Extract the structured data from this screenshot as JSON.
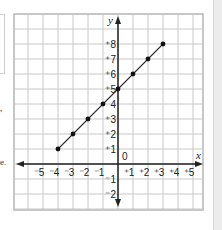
{
  "chart_data": {
    "type": "line",
    "title": "",
    "xlabel": "x",
    "ylabel": "y",
    "origin_label": "0",
    "xlim": [
      -5,
      5
    ],
    "ylim": [
      -2,
      8
    ],
    "grid": true,
    "x_ticks": [
      "-5",
      "-4",
      "-3",
      "-2",
      "-1",
      "+1",
      "+2",
      "+3",
      "+4",
      "+5"
    ],
    "y_ticks": [
      "+8",
      "+7",
      "+6",
      "+5",
      "4",
      "+3",
      "+2",
      "+1",
      "-1",
      "-2"
    ],
    "series": [
      {
        "name": "line",
        "x": [
          -4,
          -3,
          -2,
          -1,
          0,
          1,
          2,
          3
        ],
        "y": [
          1,
          2,
          3,
          4,
          5,
          6,
          7,
          8
        ],
        "markers": true
      }
    ],
    "colors": {
      "line": "#333333",
      "grid": "#c8c8c8",
      "frame": "#b5b5b5",
      "axis": "#222222"
    }
  },
  "fragments": {
    "comma": ",",
    "e_period": "e."
  }
}
